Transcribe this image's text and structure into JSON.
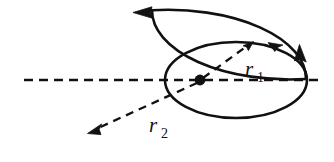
{
  "figure": {
    "background_color": "#ffffff",
    "stroke_color": "#111111",
    "width": 334,
    "height": 162,
    "axis": {
      "name": "horizontal-dashed-axis",
      "style": "dashed",
      "x1": 24,
      "y1": 80,
      "x2": 320,
      "y2": 80
    },
    "center_point": {
      "name": "common-focus-dot",
      "x": 200,
      "y": 80,
      "radius": 5.2
    },
    "ellipses": [
      {
        "name": "large-orbit-ellipse",
        "cx": 168,
        "cy": 79,
        "rx": 138,
        "ry": 69,
        "direction": "counterclockwise",
        "arrow_label": "left-pointing-arrow-top"
      },
      {
        "name": "small-orbit-ellipse",
        "cx": 236,
        "cy": 80,
        "rx": 71,
        "ry": 38,
        "direction": "counterclockwise",
        "arrow_label": "up-pointing-arrow-right"
      }
    ],
    "radii": [
      {
        "name": "radius-r1",
        "label": "r",
        "subscript": "1",
        "label_x": 245,
        "label_y": 76,
        "sub_x": 259,
        "sub_y": 82,
        "from_x": 203,
        "from_y": 78,
        "to_x": 252,
        "to_y": 43,
        "style": "dashed-arrow"
      },
      {
        "name": "radius-r2",
        "label": "r",
        "subscript": "2",
        "label_x": 150,
        "label_y": 132,
        "sub_x": 163,
        "sub_y": 138,
        "from_x": 197,
        "from_y": 83,
        "to_x": 89,
        "to_y": 133,
        "style": "dashed-arrow"
      }
    ]
  }
}
